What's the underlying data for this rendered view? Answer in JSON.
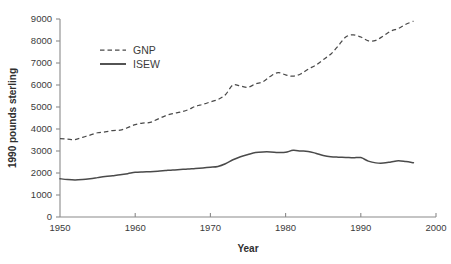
{
  "chart_data": {
    "type": "line",
    "title": "",
    "xlabel": "Year",
    "ylabel": "1990 pounds sterling",
    "xlim": [
      1950,
      2000
    ],
    "ylim": [
      0,
      9000
    ],
    "grid": false,
    "legend_position": "upper-left-inside",
    "xticks": [
      1950,
      1960,
      1970,
      1980,
      1990,
      2000
    ],
    "xtick_labels": [
      "1950",
      "1960",
      "1970",
      "1980",
      "1990",
      "2000"
    ],
    "yticks": [
      0,
      1000,
      2000,
      3000,
      4000,
      5000,
      6000,
      7000,
      8000,
      9000
    ],
    "ytick_labels": [
      "0",
      "1000",
      "2000",
      "3000",
      "4000",
      "5000",
      "6000",
      "7000",
      "8000",
      "9000"
    ],
    "x": [
      1950,
      1951,
      1952,
      1953,
      1954,
      1955,
      1956,
      1957,
      1958,
      1959,
      1960,
      1961,
      1962,
      1963,
      1964,
      1965,
      1966,
      1967,
      1968,
      1969,
      1970,
      1971,
      1972,
      1973,
      1974,
      1975,
      1976,
      1977,
      1978,
      1979,
      1980,
      1981,
      1982,
      1983,
      1984,
      1985,
      1986,
      1987,
      1988,
      1989,
      1990,
      1991,
      1992,
      1993,
      1994,
      1995,
      1996,
      1997
    ],
    "series": [
      {
        "name": "GNP",
        "style": "dashed",
        "color": "#4a4a4a",
        "values": [
          3560,
          3540,
          3520,
          3620,
          3720,
          3830,
          3870,
          3930,
          3950,
          4060,
          4200,
          4270,
          4300,
          4450,
          4600,
          4700,
          4770,
          4870,
          5030,
          5120,
          5230,
          5340,
          5560,
          6000,
          5950,
          5900,
          6050,
          6150,
          6400,
          6560,
          6460,
          6400,
          6500,
          6720,
          6900,
          7150,
          7400,
          7780,
          8180,
          8280,
          8180,
          8010,
          8030,
          8230,
          8450,
          8570,
          8760,
          8900
        ]
      },
      {
        "name": "ISEW",
        "style": "solid",
        "color": "#4a4a4a",
        "values": [
          1740,
          1700,
          1680,
          1700,
          1740,
          1790,
          1840,
          1880,
          1920,
          1970,
          2030,
          2050,
          2060,
          2080,
          2110,
          2140,
          2160,
          2180,
          2210,
          2230,
          2260,
          2300,
          2420,
          2600,
          2740,
          2840,
          2930,
          2960,
          2960,
          2930,
          2940,
          3030,
          3000,
          2980,
          2900,
          2800,
          2740,
          2720,
          2710,
          2690,
          2700,
          2540,
          2460,
          2450,
          2500,
          2560,
          2520,
          2470
        ]
      }
    ]
  },
  "legend": {
    "entries": [
      {
        "label": "GNP",
        "style": "dashed"
      },
      {
        "label": "ISEW",
        "style": "solid"
      }
    ]
  },
  "axes": {
    "x_title": "Year",
    "y_title": "1990 pounds sterling"
  }
}
